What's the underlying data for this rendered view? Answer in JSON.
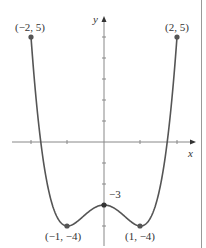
{
  "chart_data": {
    "type": "line",
    "title": "",
    "xlabel": "x",
    "ylabel": "y",
    "function": "y = x^4 - 2x^2 - 3",
    "xlim": [
      -2.6,
      2.5
    ],
    "ylim": [
      -4.8,
      5.3
    ],
    "x": [
      -2,
      -1.75,
      -1.5,
      -1.25,
      -1,
      -0.75,
      -0.5,
      -0.25,
      0,
      0.25,
      0.5,
      0.75,
      1,
      1.25,
      1.5,
      1.75,
      2
    ],
    "y": [
      5,
      0.25,
      -2.44,
      -3.68,
      -4,
      -3.81,
      -3.44,
      -3.12,
      -3,
      -3.12,
      -3.44,
      -3.81,
      -4,
      -3.68,
      -2.44,
      0.25,
      5
    ],
    "x_ticks": [
      -2,
      -1,
      0,
      1,
      2
    ],
    "y_ticks": [
      -4,
      -3,
      -2,
      -1,
      1,
      2,
      3,
      4,
      5
    ],
    "grid": false,
    "annotations": [
      {
        "x": -2,
        "y": 5,
        "text": "(−2, 5)"
      },
      {
        "x": 2,
        "y": 5,
        "text": "(2, 5)"
      },
      {
        "x": -1,
        "y": -4,
        "text": "(−1, −4)"
      },
      {
        "x": 1,
        "y": -4,
        "text": "(1, −4)"
      },
      {
        "x": 0,
        "y": -3,
        "text": "−3"
      }
    ]
  },
  "labels": {
    "x_axis": "x",
    "y_axis": "y",
    "p_left_top": "(−2, 5)",
    "p_right_top": "(2, 5)",
    "p_left_min": "(−1, −4)",
    "p_right_min": "(1, −4)",
    "p_center": "−3"
  },
  "colors": {
    "curve": "#555555",
    "axis": "#888888",
    "point": "#555555"
  }
}
